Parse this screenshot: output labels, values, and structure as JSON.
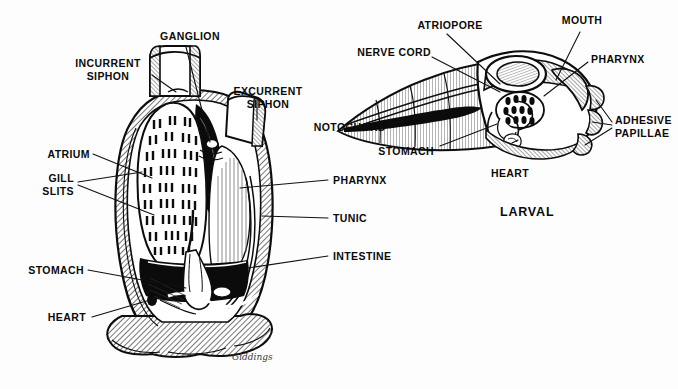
{
  "figure": {
    "title_visible": false,
    "style": "black-and-white line engraving",
    "signature": "Giddings"
  },
  "adult": {
    "caption": "",
    "labels": [
      {
        "id": "incurrent-siphon",
        "text": "INCURRENT\nSIPHON"
      },
      {
        "id": "ganglion",
        "text": "GANGLION"
      },
      {
        "id": "excurrent-siphon",
        "text": "EXCURRENT\nSIPHON"
      },
      {
        "id": "atrium",
        "text": "ATRIUM"
      },
      {
        "id": "gill-slits",
        "text": "GILL\nSLITS"
      },
      {
        "id": "stomach",
        "text": "STOMACH"
      },
      {
        "id": "heart",
        "text": "HEART"
      },
      {
        "id": "pharynx",
        "text": "PHARYNX"
      },
      {
        "id": "tunic",
        "text": "TUNIC"
      },
      {
        "id": "intestine",
        "text": "INTESTINE"
      }
    ]
  },
  "larval": {
    "caption": "LARVAL",
    "labels": [
      {
        "id": "atriopore",
        "text": "ATRIOPORE"
      },
      {
        "id": "mouth",
        "text": "MOUTH"
      },
      {
        "id": "nerve-cord",
        "text": "NERVE CORD"
      },
      {
        "id": "pharynx",
        "text": "PHARYNX"
      },
      {
        "id": "notochord",
        "text": "NOTOCHORD"
      },
      {
        "id": "adhesive-papillae",
        "text": "ADHESIVE\nPAPILLAE"
      },
      {
        "id": "stomach",
        "text": "STOMACH"
      },
      {
        "id": "heart",
        "text": "HEART"
      }
    ]
  },
  "colors": {
    "background": "#fdfdfd",
    "ink": "#0a0a0a",
    "leader_line": "#1a1a1a",
    "hatch_mid": "#8a8a8a",
    "hatch_light": "#c9c9c9"
  }
}
